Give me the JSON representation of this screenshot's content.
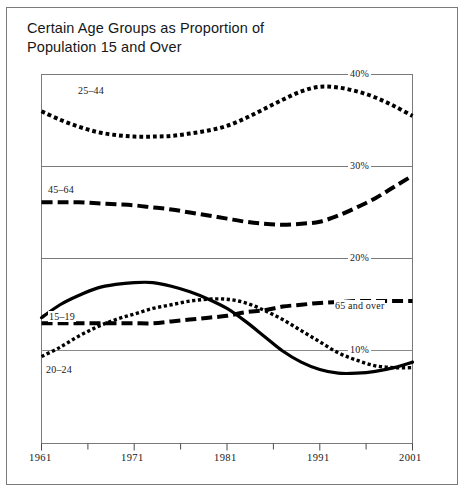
{
  "figure": {
    "title": "Certain Age Groups as Proportion of\nPopulation 15 and Over",
    "background_color": "#ffffff",
    "frame_color": "#7a7a7a",
    "ink_color": "#000000"
  },
  "chart_data": {
    "type": "line",
    "title": "Certain Age Groups as Proportion of Population 15 and Over",
    "xlabel": "",
    "ylabel": "",
    "grid": true,
    "legend_position": "inline-annotations",
    "xlim": [
      1961,
      2001
    ],
    "ylim": [
      5,
      45
    ],
    "x_ticks_major": [
      1961,
      1971,
      1981,
      1991,
      2001
    ],
    "x_tick_labels": [
      "1961",
      "1971",
      "1981",
      "1991",
      "2001"
    ],
    "x_ticks_minor": [
      1966,
      1976,
      1986,
      1996
    ],
    "y_gridlines": [
      40,
      30,
      20,
      10
    ],
    "y_gridline_labels": [
      "40%",
      "30%",
      "20%",
      "10%"
    ],
    "panels": [
      {
        "name": "top-panel",
        "y_range": [
          33,
          45
        ],
        "gridline": 40,
        "gridline_label": "40%",
        "series": [
          "25-44"
        ]
      },
      {
        "name": "middle-panel",
        "y_range": [
          22,
          31
        ],
        "gridline": 30,
        "gridline_label": "30%",
        "second_gridline": 20,
        "second_gridline_label": "20%",
        "series": [
          "45-64"
        ]
      },
      {
        "name": "bottom-panel",
        "y_range": [
          5,
          15
        ],
        "gridline": 10,
        "gridline_label": "10%",
        "series": [
          "15-19",
          "20-24",
          "65 and over"
        ]
      }
    ],
    "x": [
      1961,
      1963,
      1965,
      1967,
      1969,
      1971,
      1973,
      1975,
      1977,
      1979,
      1981,
      1983,
      1985,
      1987,
      1989,
      1991,
      1993,
      1995,
      1997,
      1999,
      2001
    ],
    "series": [
      {
        "name": "25-44",
        "label": "25–44",
        "style": "dotted",
        "line_width": 4,
        "panel": "top-panel",
        "values": [
          40.2,
          39.1,
          38.2,
          37.5,
          37.1,
          36.9,
          36.9,
          37.0,
          37.3,
          37.7,
          38.3,
          39.3,
          40.5,
          41.7,
          42.8,
          43.4,
          43.3,
          42.8,
          42.0,
          40.9,
          39.6
        ]
      },
      {
        "name": "45-64",
        "label": "45–64",
        "style": "dashed",
        "line_width": 4,
        "panel": "middle-panel",
        "values": [
          27.5,
          27.5,
          27.5,
          27.4,
          27.3,
          27.2,
          27.0,
          26.8,
          26.5,
          26.2,
          25.9,
          25.6,
          25.4,
          25.3,
          25.4,
          25.6,
          26.2,
          27.0,
          27.9,
          29.0,
          30.1
        ]
      },
      {
        "name": "15-19",
        "label": "15–19",
        "style": "solid",
        "line_width": 3.2,
        "panel": "bottom-panel",
        "values": [
          11.8,
          12.5,
          13.0,
          13.4,
          13.6,
          13.7,
          13.7,
          13.5,
          13.2,
          12.8,
          12.3,
          11.6,
          10.8,
          10.0,
          9.4,
          9.0,
          8.8,
          8.8,
          8.9,
          9.1,
          9.4
        ]
      },
      {
        "name": "20-24",
        "label": "20–24",
        "style": "dotted",
        "line_width": 3.4,
        "panel": "bottom-panel",
        "values": [
          9.7,
          10.2,
          10.8,
          11.3,
          11.7,
          12.0,
          12.3,
          12.5,
          12.7,
          12.8,
          12.8,
          12.6,
          12.2,
          11.7,
          11.1,
          10.5,
          9.9,
          9.5,
          9.2,
          9.1,
          9.1
        ]
      },
      {
        "name": "65 and over",
        "label": "65 and over",
        "style": "dashed",
        "line_width": 4,
        "panel": "bottom-panel",
        "values": [
          11.5,
          11.5,
          11.5,
          11.5,
          11.5,
          11.5,
          11.5,
          11.6,
          11.7,
          11.8,
          11.9,
          12.1,
          12.2,
          12.4,
          12.5,
          12.6,
          12.65,
          12.7,
          12.7,
          12.7,
          12.7
        ]
      }
    ],
    "annotations": [
      {
        "text": "25–44",
        "x": 1965.5,
        "y": 39.2
      },
      {
        "text": "45–64",
        "x": 1963.0,
        "y": 28.4
      },
      {
        "text": "15–19",
        "x": 1963.5,
        "y": 13.8
      },
      {
        "text": "20–24",
        "x": 1963.0,
        "y": 8.6
      },
      {
        "text": "65 and over",
        "x": 1993.5,
        "y": 13.3
      },
      {
        "text": "40%",
        "x": 1990.0,
        "y": 40.0
      },
      {
        "text": "30%",
        "x": 1990.0,
        "y": 30.0
      },
      {
        "text": "20%",
        "x": 1990.0,
        "y": 20.0
      },
      {
        "text": "10%",
        "x": 1990.0,
        "y": 10.0
      }
    ]
  },
  "axis": {
    "year_labels": [
      "1961",
      "1971",
      "1981",
      "1991",
      "2001"
    ],
    "pct_labels": [
      "40%",
      "30%",
      "20%",
      "10%"
    ]
  }
}
